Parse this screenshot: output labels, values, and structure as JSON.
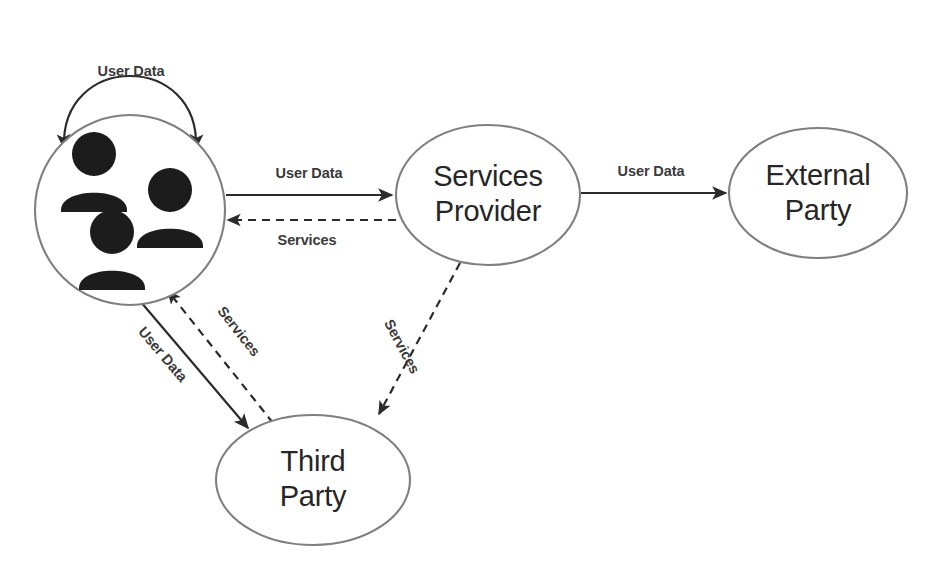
{
  "diagram": {
    "background_color": "#ffffff",
    "node_stroke_color": "#7f7f7f",
    "edge_color": "#2b2b2b",
    "label_color": "#3a3a3a",
    "nodes": [
      {
        "id": "users",
        "label": "",
        "shape": "circle",
        "icon": "users-group-icon",
        "cx": 130,
        "cy": 210,
        "r": 95
      },
      {
        "id": "services_provider",
        "label": "Services Provider",
        "line1": "Services",
        "line2": "Provider",
        "shape": "ellipse",
        "cx": 488,
        "cy": 195,
        "rx": 92,
        "ry": 70
      },
      {
        "id": "external_party",
        "label": "External Party",
        "line1": "External",
        "line2": "Party",
        "shape": "ellipse",
        "cx": 818,
        "cy": 193,
        "rx": 89,
        "ry": 65
      },
      {
        "id": "third_party",
        "label": "Third Party",
        "line1": "Third",
        "line2": "Party",
        "shape": "ellipse",
        "cx": 313,
        "cy": 480,
        "rx": 97,
        "ry": 65
      }
    ],
    "edges": [
      {
        "id": "users_self_loop",
        "from": "users",
        "to": "users",
        "label": "User Data",
        "style": "solid",
        "arrow": "both"
      },
      {
        "id": "users_to_provider",
        "from": "users",
        "to": "services_provider",
        "label": "User Data",
        "style": "solid",
        "arrow": "end"
      },
      {
        "id": "provider_to_users",
        "from": "services_provider",
        "to": "users",
        "label": "Services",
        "style": "dashed",
        "arrow": "end"
      },
      {
        "id": "provider_to_external",
        "from": "services_provider",
        "to": "external_party",
        "label": "User Data",
        "style": "solid",
        "arrow": "end"
      },
      {
        "id": "users_to_third",
        "from": "users",
        "to": "third_party",
        "label": "User Data",
        "style": "solid",
        "arrow": "end"
      },
      {
        "id": "third_to_users",
        "from": "third_party",
        "to": "users",
        "label": "Services",
        "style": "dashed",
        "arrow": "end"
      },
      {
        "id": "provider_to_third",
        "from": "services_provider",
        "to": "third_party",
        "label": "Services",
        "style": "dashed",
        "arrow": "end"
      }
    ]
  }
}
